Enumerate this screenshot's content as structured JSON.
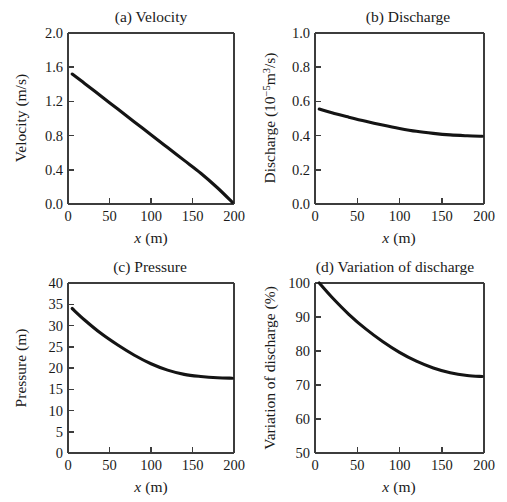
{
  "figure": {
    "background_color": "#ffffff",
    "curve_color": "#141414",
    "axis_color": "#3c3c3c",
    "panel_count": 4
  },
  "panels": {
    "a": {
      "title": "(a) Velocity",
      "xlabel_var": "x",
      "xlabel_unit": "(m)",
      "ylabel": "Velocity (m/s)",
      "xticks": [
        "0",
        "50",
        "100",
        "150",
        "200"
      ],
      "yticks": [
        "0.0",
        "0.4",
        "0.8",
        "1.2",
        "1.6",
        "2.0"
      ]
    },
    "b": {
      "title": "(b) Discharge",
      "xlabel_var": "x",
      "xlabel_unit": "(m)",
      "ylabel_main": "Discharge (10",
      "ylabel_sup": "−5",
      "ylabel_mid": "m",
      "ylabel_sup2": "3",
      "ylabel_tail": "/s)",
      "xticks": [
        "0",
        "50",
        "100",
        "150",
        "200"
      ],
      "yticks": [
        "0.0",
        "0.2",
        "0.4",
        "0.6",
        "0.8",
        "1.0"
      ]
    },
    "c": {
      "title": "(c) Pressure",
      "xlabel_var": "x",
      "xlabel_unit": "(m)",
      "ylabel": "Pressure (m)",
      "xticks": [
        "0",
        "50",
        "100",
        "150",
        "200"
      ],
      "yticks": [
        "0",
        "5",
        "10",
        "15",
        "20",
        "25",
        "30",
        "35",
        "40"
      ]
    },
    "d": {
      "title": "(d) Variation of discharge",
      "xlabel_var": "x",
      "xlabel_unit": "(m)",
      "ylabel": "Variation of discharge (%)",
      "xticks": [
        "0",
        "50",
        "100",
        "150",
        "200"
      ],
      "yticks": [
        "50",
        "60",
        "70",
        "80",
        "90",
        "100"
      ]
    }
  },
  "chart_data": [
    {
      "type": "line",
      "panel": "a",
      "title": "(a) Velocity",
      "xlabel": "x (m)",
      "ylabel": "Velocity (m/s)",
      "xlim": [
        0,
        200
      ],
      "ylim": [
        0.0,
        2.0
      ],
      "xticks": [
        0,
        50,
        100,
        150,
        200
      ],
      "yticks": [
        0.0,
        0.4,
        0.8,
        1.2,
        1.6,
        2.0
      ],
      "grid": false,
      "legend": "none",
      "x": [
        5,
        20,
        40,
        60,
        80,
        100,
        120,
        140,
        160,
        180,
        198
      ],
      "y": [
        1.52,
        1.41,
        1.26,
        1.11,
        0.96,
        0.81,
        0.66,
        0.51,
        0.36,
        0.19,
        0.02
      ]
    },
    {
      "type": "line",
      "panel": "b",
      "title": "(b) Discharge",
      "xlabel": "x (m)",
      "ylabel": "Discharge (10^-5 m^3/s)",
      "xlim": [
        0,
        200
      ],
      "ylim": [
        0.0,
        1.0
      ],
      "xticks": [
        0,
        50,
        100,
        150,
        200
      ],
      "yticks": [
        0.0,
        0.2,
        0.4,
        0.6,
        0.8,
        1.0
      ],
      "grid": false,
      "legend": "none",
      "x": [
        5,
        20,
        40,
        60,
        80,
        100,
        120,
        140,
        160,
        180,
        198
      ],
      "y": [
        0.555,
        0.533,
        0.508,
        0.484,
        0.462,
        0.442,
        0.425,
        0.413,
        0.404,
        0.399,
        0.396
      ]
    },
    {
      "type": "line",
      "panel": "c",
      "title": "(c) Pressure",
      "xlabel": "x (m)",
      "ylabel": "Pressure (m)",
      "xlim": [
        0,
        200
      ],
      "ylim": [
        0,
        40
      ],
      "xticks": [
        0,
        50,
        100,
        150,
        200
      ],
      "yticks": [
        0,
        5,
        10,
        15,
        20,
        25,
        30,
        35,
        40
      ],
      "grid": false,
      "legend": "none",
      "x": [
        5,
        20,
        40,
        60,
        80,
        100,
        120,
        140,
        160,
        180,
        198
      ],
      "y": [
        34.0,
        31.3,
        28.1,
        25.4,
        23.0,
        21.0,
        19.5,
        18.5,
        18.0,
        17.7,
        17.6
      ]
    },
    {
      "type": "line",
      "panel": "d",
      "title": "(d) Variation of discharge",
      "xlabel": "x (m)",
      "ylabel": "Variation of discharge (%)",
      "xlim": [
        0,
        200
      ],
      "ylim": [
        50,
        100
      ],
      "xticks": [
        0,
        50,
        100,
        150,
        200
      ],
      "yticks": [
        50,
        60,
        70,
        80,
        90,
        100
      ],
      "grid": false,
      "legend": "none",
      "x": [
        5,
        20,
        40,
        60,
        80,
        100,
        120,
        140,
        160,
        180,
        198
      ],
      "y": [
        100.0,
        95.8,
        90.8,
        86.5,
        82.8,
        79.6,
        77.0,
        75.0,
        73.6,
        72.8,
        72.5
      ]
    }
  ]
}
